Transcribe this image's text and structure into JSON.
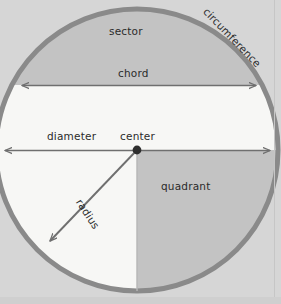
{
  "diagram": {
    "type": "geometry-circle-annotated",
    "labels": {
      "sector": "sector",
      "chord": "chord",
      "diameter": "diameter",
      "center": "center",
      "radius": "radius",
      "quadrant": "quadrant",
      "circumference": "circumference",
      "edge_clipped": "arc"
    },
    "colors": {
      "page_background": "#d6d6d6",
      "circle_stroke": "#8a8a8a",
      "shaded_fill": "#c3c3c3",
      "white_fill": "#f7f7f5",
      "arrow_stroke": "#6f6f6f",
      "label_text": "#2b2b2b",
      "center_dot": "#2e2e2e"
    },
    "geometry": {
      "center_x": 137,
      "center_y": 150,
      "radius_px": 143,
      "chord_y": 85,
      "chord_x_start": 20,
      "chord_x_end": 258,
      "diameter_y": 150,
      "diameter_x_start": 3,
      "diameter_x_end": 272,
      "radius_tip_x": 48,
      "radius_tip_y": 243,
      "quadrant_start_angle_deg": 0,
      "quadrant_end_angle_deg": 90
    }
  }
}
